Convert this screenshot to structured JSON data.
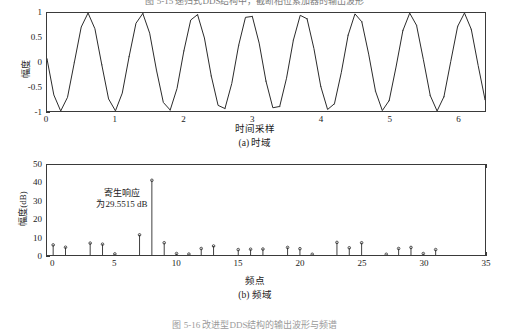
{
  "top_caption_fragment": "图 5-15   递归式DDS结构中，截断相位累加器的输出波形",
  "bottom_caption_fragment": "图 5-16   改进型DDS结构的输出波形与频谱",
  "figure_a": {
    "caption": "(a) 时域",
    "xlabel": "时间采样",
    "ylabel": "幅度",
    "chart_data": {
      "type": "line",
      "title": "",
      "xlabel": "时间采样",
      "ylabel": "幅度",
      "xlim": [
        0,
        6.4
      ],
      "ylim": [
        -1,
        1
      ],
      "xticks": [
        "0",
        "1",
        "2",
        "3",
        "4",
        "5",
        "6"
      ],
      "xtick_values": [
        0,
        1,
        2,
        3,
        4,
        5,
        6
      ],
      "yticks": [
        "1",
        "0.5",
        "0",
        "-0.5",
        "-1"
      ],
      "ytick_values": [
        1,
        0.5,
        0,
        -0.5,
        -1
      ],
      "grid": false,
      "legend": "none",
      "series": [
        {
          "name": "正弦波形",
          "description": "约8个周期的正弦波，初相约0.55π，幅度1",
          "cycles": 8,
          "amplitude": 1,
          "phase_start": 0.98,
          "samples": 64,
          "marker": "dot"
        }
      ]
    }
  },
  "figure_b": {
    "caption": "(b) 频域",
    "xlabel": "频点",
    "ylabel": "幅度(dB)",
    "annotation_line1": "寄生响应",
    "annotation_line2": "为29.5515 dB",
    "chart_data": {
      "type": "bar",
      "subtype": "stem",
      "title": "",
      "xlabel": "频点",
      "ylabel": "幅度(dB)",
      "xlim": [
        -0.5,
        35
      ],
      "ylim": [
        0,
        50
      ],
      "xticks": [
        "0",
        "5",
        "10",
        "15",
        "20",
        "25",
        "30",
        "35"
      ],
      "xtick_values": [
        0,
        5,
        10,
        15,
        20,
        25,
        30,
        35
      ],
      "yticks": [
        "0",
        "10",
        "20",
        "30",
        "40",
        "50"
      ],
      "ytick_values": [
        0,
        10,
        20,
        30,
        40,
        50
      ],
      "grid": false,
      "legend": "none",
      "annotations": [
        "寄生响应",
        "为29.5515 dB"
      ],
      "categories": [
        0,
        1,
        2,
        3,
        4,
        5,
        6,
        7,
        8,
        9,
        10,
        11,
        12,
        13,
        14,
        15,
        16,
        17,
        18,
        19,
        20,
        21,
        22,
        23,
        24,
        25,
        26,
        27,
        28,
        29,
        30,
        31,
        32
      ],
      "values": [
        5.6,
        4.3,
        0,
        6.6,
        6.0,
        0.6,
        0,
        11.2,
        41.5,
        6.8,
        0.8,
        0.5,
        3.6,
        5.0,
        0,
        3.0,
        3.2,
        3.3,
        0,
        4.2,
        3.5,
        0.4,
        0,
        7.0,
        4.0,
        6.8,
        0,
        0.4,
        3.6,
        4.2,
        0.8,
        3.0,
        0
      ]
    }
  }
}
